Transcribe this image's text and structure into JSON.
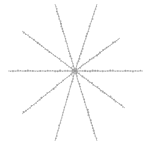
{
  "figure": {
    "title": "",
    "background_color": "#ffffff",
    "width": 151,
    "height": 145
  },
  "chart_data": {
    "type": "scatter",
    "title": "",
    "subtitle": "",
    "xlabel": "",
    "ylabel": "",
    "grid": false,
    "legend": false,
    "legend_position": "none",
    "axis_visible": false,
    "tick_labels_x": [],
    "tick_labels_y": [],
    "xlim": [
      0,
      151
    ],
    "ylim": [
      0,
      145
    ],
    "center": {
      "x": 75,
      "y": 71
    },
    "ray_count": 10,
    "angle_step_degrees": 36,
    "line_color": "#a8a8a8",
    "marker_color": "#9a9a9a",
    "line_width": 0.7,
    "marker_size": 0.75,
    "markers_per_ray": 26,
    "rays": [
      {
        "name": "ray-1",
        "angle_degrees": 0,
        "length": 68,
        "end": {
          "x": 143,
          "y": 71
        }
      },
      {
        "name": "ray-2",
        "angle_degrees": 36,
        "length": 56,
        "end": {
          "x": 120,
          "y": 38
        }
      },
      {
        "name": "ray-3",
        "angle_degrees": 72,
        "length": 70,
        "end": {
          "x": 97,
          "y": 4
        }
      },
      {
        "name": "ray-4",
        "angle_degrees": 108,
        "length": 70,
        "end": {
          "x": 55,
          "y": 4
        }
      },
      {
        "name": "ray-5",
        "angle_degrees": 144,
        "length": 66,
        "end": {
          "x": 22,
          "y": 31
        }
      },
      {
        "name": "ray-6",
        "angle_degrees": 180,
        "length": 68,
        "end": {
          "x": 8,
          "y": 71
        }
      },
      {
        "name": "ray-7",
        "angle_degrees": 216,
        "length": 66,
        "end": {
          "x": 22,
          "y": 114
        }
      },
      {
        "name": "ray-8",
        "angle_degrees": 252,
        "length": 70,
        "end": {
          "x": 55,
          "y": 141
        }
      },
      {
        "name": "ray-9",
        "angle_degrees": 288,
        "length": 70,
        "end": {
          "x": 97,
          "y": 141
        }
      },
      {
        "name": "ray-10",
        "angle_degrees": 324,
        "length": 56,
        "end": {
          "x": 125,
          "y": 108
        }
      }
    ]
  }
}
